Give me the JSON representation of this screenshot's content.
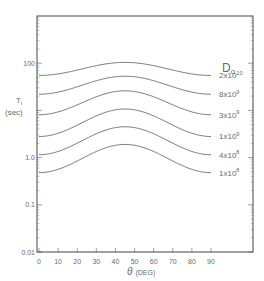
{
  "chart_data": {
    "type": "line",
    "title": "",
    "xlabel": "θ (DEG)",
    "ylabel": "Ti (sec)",
    "ylabel_main": "T",
    "ylabel_sub": "i",
    "ylabel_unit": "(sec)",
    "xlabel_symbol": "θ",
    "xlabel_unit": "(DEG)",
    "xscale": "linear",
    "yscale": "log",
    "xlim": [
      0,
      90
    ],
    "ylim": [
      0.01,
      1000
    ],
    "xticks": [
      0,
      10,
      20,
      30,
      40,
      50,
      60,
      70,
      80,
      90
    ],
    "xtick_labels": [
      "0",
      "10",
      "20",
      "30",
      "40",
      "50",
      "60",
      "70",
      "80",
      "90"
    ],
    "yticks": [
      0.01,
      0.1,
      1.0,
      100
    ],
    "ytick_labels": [
      "0.01",
      "0.1",
      "1.0",
      "100"
    ],
    "grid": false,
    "legend_title": "Do",
    "legend_title_main": "D",
    "legend_title_sub": "o",
    "legend_placement": "right, labels at curve ends",
    "x": [
      0,
      10,
      20,
      30,
      40,
      45,
      50,
      60,
      70,
      80,
      90
    ],
    "series": [
      {
        "name": "2x10^10",
        "label_base": "2x10",
        "label_exp": "10",
        "values": [
          55,
          58,
          67,
          82,
          99,
          104,
          99,
          82,
          67,
          58,
          55
        ]
      },
      {
        "name": "8x10^9",
        "label_base": "8x10",
        "label_exp": "9",
        "values": [
          22,
          24,
          29,
          38,
          50,
          53,
          50,
          38,
          29,
          24,
          22
        ]
      },
      {
        "name": "3x10^9",
        "label_base": "3x10",
        "label_exp": "9",
        "values": [
          8.1,
          8.9,
          11,
          16,
          24,
          26,
          24,
          16,
          11,
          8.9,
          8.1
        ]
      },
      {
        "name": "1x10^9",
        "label_base": "1x10",
        "label_exp": "9",
        "values": [
          2.8,
          3.1,
          4.0,
          6.0,
          9.8,
          10.7,
          9.8,
          6.0,
          4.0,
          3.1,
          2.8
        ]
      },
      {
        "name": "4x10^8",
        "label_base": "4x10",
        "label_exp": "8",
        "values": [
          1.15,
          1.25,
          1.6,
          2.4,
          4.1,
          4.5,
          4.1,
          2.4,
          1.6,
          1.25,
          1.15
        ]
      },
      {
        "name": "1x10^8",
        "label_base": "1x10",
        "label_exp": "8",
        "values": [
          0.48,
          0.52,
          0.68,
          1.0,
          1.75,
          1.9,
          1.75,
          1.0,
          0.68,
          0.52,
          0.48
        ]
      }
    ]
  }
}
